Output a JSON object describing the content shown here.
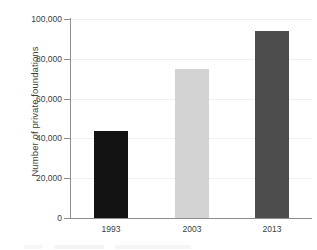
{
  "chart_data": {
    "type": "bar",
    "title": "",
    "xlabel": "",
    "ylabel": "Number of private foundations",
    "categories": [
      "1993",
      "2003",
      "2013"
    ],
    "values": [
      43500,
      75000,
      94000
    ],
    "series": [
      {
        "name": "Number of private foundations",
        "values": [
          43500,
          75000,
          94000
        ]
      }
    ],
    "ylim": [
      0,
      100000
    ],
    "yticks": [
      0,
      20000,
      40000,
      60000,
      80000,
      100000
    ],
    "ytick_labels": [
      "0",
      "20,000",
      "40,000",
      "60,000",
      "80,000",
      "100,000"
    ],
    "grid": true,
    "grid_axis": "y",
    "legend": "none",
    "bar_colors": [
      "#131313",
      "#d2d2d2",
      "#4d4d4d"
    ],
    "axis_color": "#8d8d8d",
    "grid_color": "#f0eeee",
    "text_color": "#3d3d3d",
    "background": "#ffffff"
  }
}
